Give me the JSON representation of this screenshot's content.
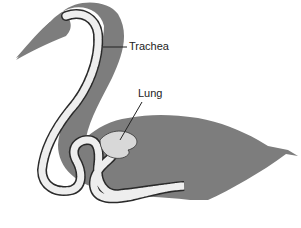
{
  "figure": {
    "labels": {
      "trachea": "Trachea",
      "lung": "Lung"
    },
    "colors": {
      "body": "#7d7d7d",
      "trachea_rings": "#eeeeee",
      "trachea_outline": "#2a2a2a",
      "lung": "#d8d8d8",
      "background": "#ffffff"
    }
  }
}
